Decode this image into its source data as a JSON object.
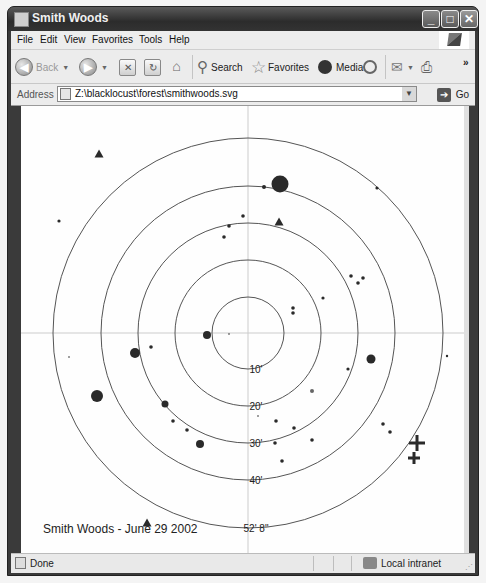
{
  "window": {
    "title": "Smith Woods",
    "controls": {
      "minimize": "_",
      "maximize": "□",
      "close": "✕"
    }
  },
  "menu": {
    "items": [
      {
        "label": "File",
        "accel": "F"
      },
      {
        "label": "Edit",
        "accel": "E"
      },
      {
        "label": "View",
        "accel": "V"
      },
      {
        "label": "Favorites",
        "accel": "a"
      },
      {
        "label": "Tools",
        "accel": "T"
      },
      {
        "label": "Help",
        "accel": "H"
      }
    ]
  },
  "toolbar": {
    "back_label": "Back",
    "search_label": "Search",
    "favorites_label": "Favorites",
    "media_label": "Media",
    "overflow": "»"
  },
  "address": {
    "label": "Address",
    "value": "Z:\\blacklocust\\forest\\smithwoods.svg",
    "go_label": "Go"
  },
  "status": {
    "text": "Done",
    "zone": "Local intranet"
  },
  "chart_data": {
    "type": "scatter",
    "title": "Smith Woods - June 29 2002",
    "center": [
      227,
      227
    ],
    "rings": [
      {
        "label": "10'",
        "radius": 36
      },
      {
        "label": "20'",
        "radius": 73
      },
      {
        "label": "30'",
        "radius": 110
      },
      {
        "label": "40'",
        "radius": 147
      },
      {
        "label": "52' 8\"",
        "radius": 195
      }
    ],
    "crosshair": true,
    "points": [
      {
        "x": 259,
        "y": 78,
        "r": 8.5,
        "shape": "circle"
      },
      {
        "x": 243,
        "y": 81,
        "r": 2,
        "shape": "circle"
      },
      {
        "x": 356,
        "y": 82,
        "r": 1.6,
        "shape": "circle"
      },
      {
        "x": 222,
        "y": 110,
        "r": 1.8,
        "shape": "circle"
      },
      {
        "x": 208,
        "y": 120,
        "r": 1.8,
        "shape": "circle"
      },
      {
        "x": 203,
        "y": 131,
        "r": 1.8,
        "shape": "circle"
      },
      {
        "x": 38,
        "y": 115,
        "r": 1.6,
        "shape": "circle"
      },
      {
        "x": 330,
        "y": 170,
        "r": 1.8,
        "shape": "circle"
      },
      {
        "x": 337,
        "y": 177,
        "r": 1.8,
        "shape": "circle"
      },
      {
        "x": 342,
        "y": 172,
        "r": 1.8,
        "shape": "circle"
      },
      {
        "x": 272,
        "y": 202,
        "r": 1.8,
        "shape": "circle"
      },
      {
        "x": 272,
        "y": 207,
        "r": 1.8,
        "shape": "circle"
      },
      {
        "x": 302,
        "y": 192,
        "r": 1.6,
        "shape": "circle"
      },
      {
        "x": 186,
        "y": 229,
        "r": 4,
        "shape": "circle"
      },
      {
        "x": 208,
        "y": 228,
        "r": 0.8,
        "shape": "circle"
      },
      {
        "x": 114,
        "y": 247,
        "r": 5,
        "shape": "circle"
      },
      {
        "x": 130,
        "y": 241,
        "r": 1.8,
        "shape": "circle"
      },
      {
        "x": 48,
        "y": 251,
        "r": 0.8,
        "shape": "circle"
      },
      {
        "x": 350,
        "y": 253,
        "r": 4.5,
        "shape": "circle"
      },
      {
        "x": 426,
        "y": 250,
        "r": 1.2,
        "shape": "circle"
      },
      {
        "x": 327,
        "y": 263,
        "r": 1.6,
        "shape": "circle"
      },
      {
        "x": 76,
        "y": 290,
        "r": 6,
        "shape": "circle"
      },
      {
        "x": 291,
        "y": 285,
        "r": 2,
        "shape": "circle",
        "color": "#666"
      },
      {
        "x": 144,
        "y": 298,
        "r": 3.5,
        "shape": "circle"
      },
      {
        "x": 237,
        "y": 310,
        "r": 0.8,
        "shape": "circle"
      },
      {
        "x": 255,
        "y": 315,
        "r": 1.8,
        "shape": "circle"
      },
      {
        "x": 273,
        "y": 322,
        "r": 1.8,
        "shape": "circle"
      },
      {
        "x": 152,
        "y": 315,
        "r": 1.8,
        "shape": "circle"
      },
      {
        "x": 166,
        "y": 324,
        "r": 1.8,
        "shape": "circle"
      },
      {
        "x": 362,
        "y": 318,
        "r": 1.8,
        "shape": "circle"
      },
      {
        "x": 369,
        "y": 326,
        "r": 1.8,
        "shape": "circle"
      },
      {
        "x": 254,
        "y": 337,
        "r": 1.8,
        "shape": "circle"
      },
      {
        "x": 291,
        "y": 334,
        "r": 1.8,
        "shape": "circle"
      },
      {
        "x": 179,
        "y": 338,
        "r": 4,
        "shape": "circle"
      },
      {
        "x": 261,
        "y": 355,
        "r": 1.8,
        "shape": "circle"
      }
    ],
    "triangles": [
      {
        "x": 78,
        "y": 48
      },
      {
        "x": 258,
        "y": 116
      },
      {
        "x": 126,
        "y": 417
      }
    ],
    "crosses": [
      {
        "x": 396,
        "y": 337,
        "size": 8
      },
      {
        "x": 393,
        "y": 352,
        "size": 6
      }
    ],
    "colors": {
      "ink": "#2a2a2a",
      "ring": "#555555",
      "crosshair": "#cccccc"
    }
  }
}
